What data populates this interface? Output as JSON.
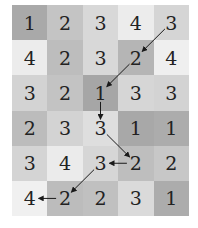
{
  "grid": {
    "rows": 6,
    "cols": 5,
    "values": [
      [
        1,
        2,
        3,
        4,
        3
      ],
      [
        4,
        2,
        3,
        2,
        4
      ],
      [
        3,
        2,
        1,
        3,
        3
      ],
      [
        2,
        3,
        3,
        1,
        1
      ],
      [
        3,
        4,
        3,
        2,
        2
      ],
      [
        4,
        2,
        2,
        3,
        1
      ]
    ],
    "shades": [
      [
        "#a9a9a9",
        "#c4c4c4",
        "#d8d8d8",
        "#ececec",
        "#d5d5d5"
      ],
      [
        "#ececec",
        "#bdbdbd",
        "#d8d8d8",
        "#b5b5b5",
        "#efefef"
      ],
      [
        "#d3d3d3",
        "#c3c3c3",
        "#a6a6a6",
        "#d6d6d6",
        "#d3d3d3"
      ],
      [
        "#bcbcbc",
        "#d3d3d3",
        "#dedede",
        "#a8a8a8",
        "#acacac"
      ],
      [
        "#d4d4d4",
        "#ebebeb",
        "#d6d6d6",
        "#bebebe",
        "#c7c7c7"
      ],
      [
        "#f0f0f0",
        "#bcbcbc",
        "#c0c0c0",
        "#dadada",
        "#acacac"
      ]
    ]
  },
  "path": [
    {
      "from": [
        0,
        4
      ],
      "to": [
        1,
        3
      ]
    },
    {
      "from": [
        1,
        3
      ],
      "to": [
        2,
        2
      ]
    },
    {
      "from": [
        2,
        2
      ],
      "to": [
        3,
        2
      ]
    },
    {
      "from": [
        3,
        2
      ],
      "to": [
        4,
        3
      ]
    },
    {
      "from": [
        4,
        3
      ],
      "to": [
        4,
        2
      ]
    },
    {
      "from": [
        4,
        2
      ],
      "to": [
        5,
        1
      ]
    },
    {
      "from": [
        5,
        1
      ],
      "to": [
        5,
        0
      ]
    }
  ],
  "colors": {
    "arrow": "#1a1a1a",
    "text": "#222222"
  }
}
